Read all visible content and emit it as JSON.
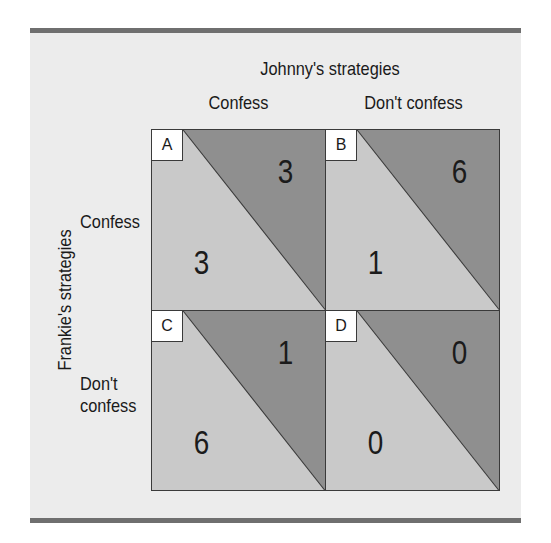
{
  "diagram": {
    "type": "payoff-matrix",
    "column_player_title": "Johnny's strategies",
    "row_player_title": "Frankie's strategies",
    "columns": [
      "Confess",
      "Don't confess"
    ],
    "rows": [
      "Confess",
      "Don't\nconfess"
    ],
    "cells": [
      {
        "label": "A",
        "row": "Confess",
        "column": "Confess",
        "johnny_payoff": "3",
        "frankie_payoff": "3"
      },
      {
        "label": "B",
        "row": "Confess",
        "column": "Don't confess",
        "johnny_payoff": "6",
        "frankie_payoff": "1"
      },
      {
        "label": "C",
        "row": "Don't confess",
        "column": "Confess",
        "johnny_payoff": "1",
        "frankie_payoff": "6"
      },
      {
        "label": "D",
        "row": "Don't confess",
        "column": "Don't confess",
        "johnny_payoff": "0",
        "frankie_payoff": "0"
      }
    ],
    "colors": {
      "frame_background": "#ececec",
      "frame_bars": "#6f6f6f",
      "upper_triangle": "#8f8f8f",
      "lower_triangle": "#c9c9c9",
      "label_box": "#ffffff",
      "lines": "#3a3a3a"
    }
  }
}
